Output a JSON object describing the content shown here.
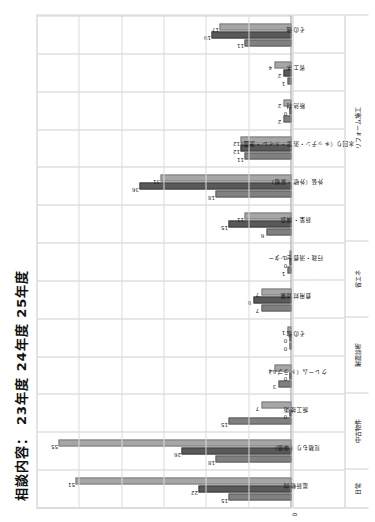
{
  "chart_data": {
    "type": "bar",
    "title": "相談内容： 23年度  24年度  25年度",
    "legend": [
      "23年度",
      "24年度",
      "25年度"
    ],
    "legend_position": "top-left",
    "xlabel": "",
    "ylabel": "",
    "ylim": [
      0,
      60
    ],
    "yticks": [
      0,
      10,
      20,
      30,
      40,
      50,
      60
    ],
    "ytick_labels": [
      "0",
      "",
      "",
      "",
      "",
      "",
      ""
    ],
    "grid": true,
    "categories": [
      "最新動向",
      "見積もり（単価）",
      "施工技術",
      "クレーム（トラブル）",
      "その他",
      "費用対効果",
      "行政・消費センター",
      "新築・構造",
      "外装（外壁・屋根）",
      "水回り（キッチン・浴室・トイレ・洗面）",
      "断熱材",
      "省エネ",
      "その他"
    ],
    "groups": [
      {
        "label": "日常",
        "span": 1
      },
      {
        "label": "中古物件",
        "span": 2
      },
      {
        "label": "耐震診断",
        "span": 2
      },
      {
        "label": "省エネ",
        "span": 2
      },
      {
        "label": "リフォーム施工",
        "span": 6
      }
    ],
    "series": [
      {
        "name": "23年度",
        "color": "#808080",
        "values": [
          15,
          18,
          15,
          3,
          0,
          7,
          1,
          6,
          18,
          11,
          2,
          1,
          11
        ]
      },
      {
        "name": "24年度",
        "color": "#595959",
        "values": [
          22,
          26,
          0,
          0,
          0,
          9,
          0,
          15,
          36,
          12,
          0,
          2,
          19
        ]
      },
      {
        "name": "25年度",
        "color": "#a6a6a6",
        "values": [
          51,
          55,
          7,
          4,
          1,
          7,
          0,
          11,
          31,
          12,
          2,
          4,
          17
        ]
      }
    ]
  }
}
